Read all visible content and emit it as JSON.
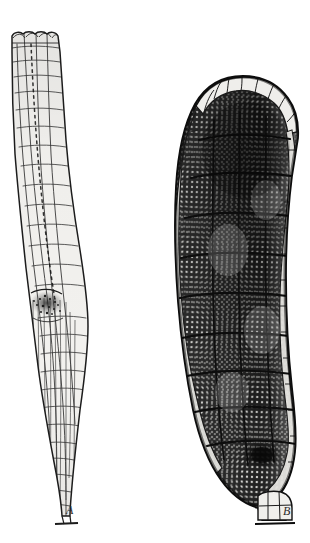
{
  "plate": {
    "kind": "botanical-illustration",
    "technique": "pen-and-ink engraving, monochrome halftone",
    "background_color": "#ffffff",
    "ink_color": "#1a1a1a",
    "width": 310,
    "height": 543,
    "panel_count": 2
  },
  "figures": [
    {
      "id": "A",
      "label": "A",
      "label_style": "italic-serif",
      "label_x": 66,
      "label_y": 504,
      "position": "left",
      "description": "Slender elongated tubular organ with longitudinal rows of large pale outlined cells; narrow flared apex at top, swollen venter region near lower third containing a dark granular mass, tapering to a fine stalk at base.",
      "bbox": [
        8,
        28,
        96,
        520
      ],
      "outline_color": "#1c1c1c",
      "cell_fill": "#f2f1ee",
      "tone": "light",
      "dark_spot": {
        "cx": 47,
        "cy": 303,
        "rx": 16,
        "ry": 11
      }
    },
    {
      "id": "B",
      "label": "B",
      "label_style": "italic-serif",
      "label_x": 283,
      "label_y": 505,
      "position": "right",
      "description": "Large club-shaped (clavate) organ densely packed with minute spore-like cells rendered as fine stipple; pale cap of large clear cells across the rounded apex, broad body with segmented jacket layer, narrowing to a short cellular stalk at base.",
      "bbox": [
        172,
        74,
        302,
        522
      ],
      "outline_color": "#141414",
      "cell_fill": "#4a4a4a",
      "tone": "dark",
      "apex_cap_color": "#ededea",
      "dark_spot": {
        "cx": 262,
        "cy": 455,
        "rx": 17,
        "ry": 12
      }
    }
  ],
  "caption": {
    "text": "",
    "visible": false
  }
}
